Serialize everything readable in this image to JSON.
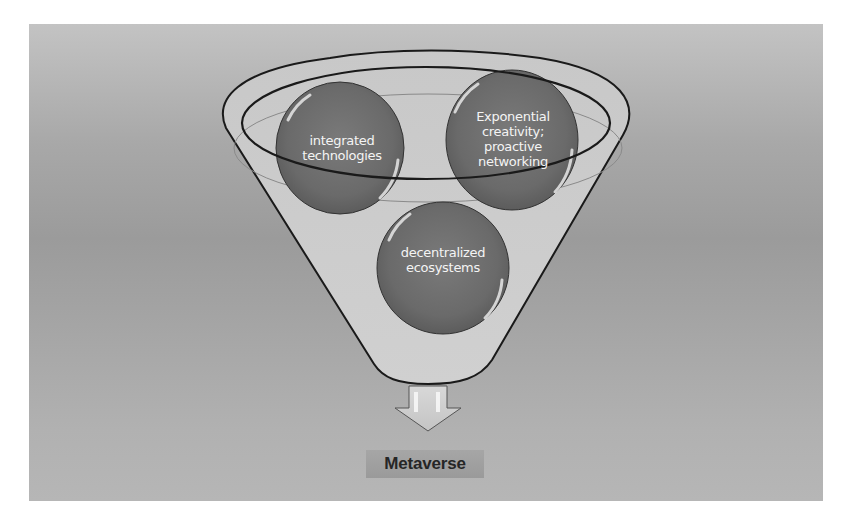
{
  "diagram": {
    "type": "funnel",
    "inputs": [
      {
        "id": "integrated-technologies",
        "label": "integrated technologies",
        "lines": [
          "integrated",
          "technologies"
        ]
      },
      {
        "id": "exponential-creativity",
        "label": "Exponential creativity; proactive networking",
        "lines": [
          "Exponential",
          "creativity;",
          "proactive",
          "networking"
        ]
      },
      {
        "id": "decentralized-ecosystems",
        "label": "decentralized ecosystems",
        "lines": [
          "decentralized",
          "ecosystems"
        ]
      }
    ],
    "arrow": {
      "direction": "down"
    },
    "output": {
      "label": "Metaverse"
    }
  },
  "colors": {
    "background": "#ffffff",
    "panel": "#a8a8a8",
    "funnel_fill": "#c6c6c6",
    "bubble": "#6e6e6e",
    "outline": "#1a1a1a",
    "bubble_text": "#f4f4f4",
    "label_text": "#262626"
  }
}
